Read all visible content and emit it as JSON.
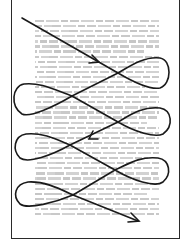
{
  "diagram": {
    "type": "reading-pattern",
    "page": {
      "border_color": "#2a2a2a",
      "background": "#ffffff"
    },
    "text_block": {
      "line_count": 39,
      "line_color": "#c9c9c9",
      "legible": false
    },
    "path": {
      "stroke_color": "#1a1a1a",
      "start": [
        22,
        18
      ],
      "crossings": [
        [
          118,
          73
        ],
        [
          72,
          96
        ],
        [
          118,
          122
        ],
        [
          70,
          145
        ],
        [
          115,
          170
        ],
        [
          73,
          195
        ]
      ],
      "right_loop_extent_x": 170,
      "left_loop_extent_x": 16,
      "end": [
        138,
        221
      ],
      "arrowheads": [
        "arrow-icon-1",
        "arrow-icon-2",
        "arrow-icon-end"
      ]
    }
  }
}
